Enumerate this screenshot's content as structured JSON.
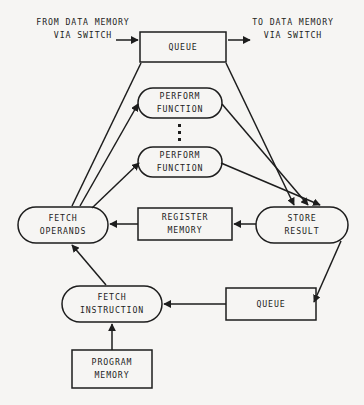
{
  "diagram": {
    "background_color": "#f6f5f3",
    "line_color": "#1d1d1d",
    "text_color": "#1d1d1d",
    "edge_labels": {
      "input": "FROM DATA MEMORY\nVIA SWITCH",
      "output": "TO DATA MEMORY\nVIA SWITCH"
    },
    "nodes": {
      "queue_top": {
        "label": "QUEUE",
        "shape": "rectangle"
      },
      "perform_function_1": {
        "label": "PERFORM\nFUNCTION",
        "shape": "stadium"
      },
      "perform_function_2": {
        "label": "PERFORM\nFUNCTION",
        "shape": "stadium"
      },
      "ellipsis": {
        "label": "⋮",
        "shape": "dots"
      },
      "fetch_operands": {
        "label": "FETCH\nOPERANDS",
        "shape": "stadium"
      },
      "register_memory": {
        "label": "REGISTER\nMEMORY",
        "shape": "rectangle"
      },
      "store_result": {
        "label": "STORE\nRESULT",
        "shape": "stadium"
      },
      "fetch_instruction": {
        "label": "FETCH\nINSTRUCTION",
        "shape": "stadium"
      },
      "queue_bottom": {
        "label": "QUEUE",
        "shape": "rectangle"
      },
      "program_memory": {
        "label": "PROGRAM\nMEMORY",
        "shape": "rectangle"
      }
    },
    "connections": [
      {
        "from": "data_memory_in",
        "to": "queue_top",
        "arrow": true
      },
      {
        "from": "queue_top",
        "to": "data_memory_out",
        "arrow": true
      },
      {
        "from": "fetch_operands",
        "to": "queue_top",
        "arrow": false
      },
      {
        "from": "fetch_operands",
        "to": "perform_function_1",
        "arrow": true
      },
      {
        "from": "fetch_operands",
        "to": "perform_function_2",
        "arrow": true
      },
      {
        "from": "queue_top",
        "to": "store_result",
        "arrow": true
      },
      {
        "from": "perform_function_1",
        "to": "store_result",
        "arrow": true
      },
      {
        "from": "perform_function_2",
        "to": "store_result",
        "arrow": true
      },
      {
        "from": "register_memory",
        "to": "fetch_operands",
        "arrow": true
      },
      {
        "from": "store_result",
        "to": "register_memory",
        "arrow": true
      },
      {
        "from": "store_result",
        "to": "queue_bottom",
        "arrow": true
      },
      {
        "from": "queue_bottom",
        "to": "fetch_instruction",
        "arrow": true
      },
      {
        "from": "fetch_instruction",
        "to": "fetch_operands",
        "arrow": true
      },
      {
        "from": "program_memory",
        "to": "fetch_instruction",
        "arrow": true
      }
    ]
  }
}
